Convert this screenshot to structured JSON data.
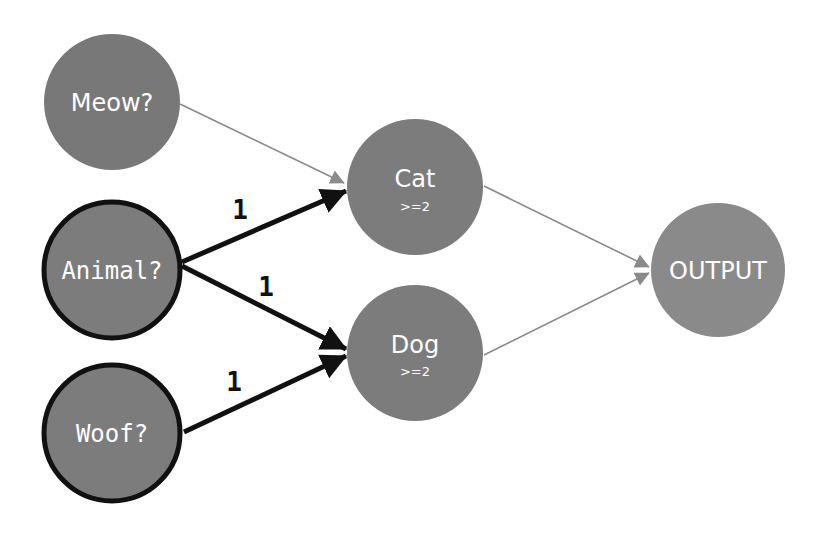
{
  "diagram": {
    "colors": {
      "node_fill": "#787878",
      "output_fill": "#8a8a8a",
      "active_border": "#111111",
      "strong_edge": "#111111",
      "weak_edge": "#8a8a8a",
      "label_text": "#ffffff"
    },
    "nodes": {
      "meow": {
        "label": "Meow?",
        "active": false
      },
      "animal": {
        "label": "Animal?",
        "active": true
      },
      "woof": {
        "label": "Woof?",
        "active": true
      },
      "cat": {
        "label": "Cat",
        "threshold": ">=2"
      },
      "dog": {
        "label": "Dog",
        "threshold": ">=2"
      },
      "output": {
        "label": "OUTPUT"
      }
    },
    "edges": [
      {
        "from": "Meow?",
        "to": "Cat",
        "weight": "",
        "style": "thin"
      },
      {
        "from": "Animal?",
        "to": "Cat",
        "weight": "1",
        "style": "thick"
      },
      {
        "from": "Animal?",
        "to": "Dog",
        "weight": "1",
        "style": "thick"
      },
      {
        "from": "Woof?",
        "to": "Dog",
        "weight": "1",
        "style": "thick"
      },
      {
        "from": "Cat",
        "to": "OUTPUT",
        "weight": "",
        "style": "thin"
      },
      {
        "from": "Dog",
        "to": "OUTPUT",
        "weight": "",
        "style": "thin"
      }
    ]
  }
}
